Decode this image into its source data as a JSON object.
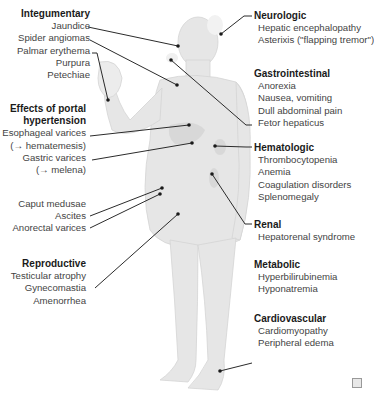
{
  "diagram": {
    "colors": {
      "body": "#e6e6e6",
      "body_shade": "#d6d6d6",
      "line": "#2b2b2b",
      "text": "#444444",
      "header": "#1a1a1a"
    },
    "groups_left": [
      {
        "id": "integumentary",
        "header": "Integumentary",
        "items": [
          "Jaundice",
          "Spider angiomas",
          "Palmar erythema",
          "Purpura",
          "Petechiae"
        ]
      },
      {
        "id": "portal",
        "header": "Effects of portal",
        "header2": "hypertension",
        "items": [
          "Esophageal varices",
          "(→ hematemesis)",
          "Gastric varices",
          "(→ melena)"
        ]
      },
      {
        "id": "portal2",
        "items": [
          "Caput medusae",
          "Ascites",
          "Anorectal varices"
        ]
      },
      {
        "id": "reproductive",
        "header": "Reproductive",
        "items": [
          "Testicular atrophy",
          "Gynecomastia",
          "Amenorrhea"
        ]
      }
    ],
    "groups_right": [
      {
        "id": "neurologic",
        "header": "Neurologic",
        "items": [
          "Hepatic encephalopathy",
          "Asterixis (\"flapping tremor\")"
        ]
      },
      {
        "id": "gastrointestinal",
        "header": "Gastrointestinal",
        "items": [
          "Anorexia",
          "Nausea, vomiting",
          "Dull abdominal pain",
          "Fetor hepaticus"
        ]
      },
      {
        "id": "hematologic",
        "header": "Hematologic",
        "items": [
          "Thrombocytopenia",
          "Anemia",
          "Coagulation disorders",
          "Splenomegaly"
        ]
      },
      {
        "id": "renal",
        "header": "Renal",
        "items": [
          "Hepatorenal syndrome"
        ]
      },
      {
        "id": "metabolic",
        "header": "Metabolic",
        "items": [
          "Hyperbilirubinemia",
          "Hyponatremia"
        ]
      },
      {
        "id": "cardiovascular",
        "header": "Cardiovascular",
        "items": [
          "Cardiomyopathy",
          "Peripheral edema"
        ]
      }
    ],
    "logo_icon": "publisher-logo-icon"
  }
}
